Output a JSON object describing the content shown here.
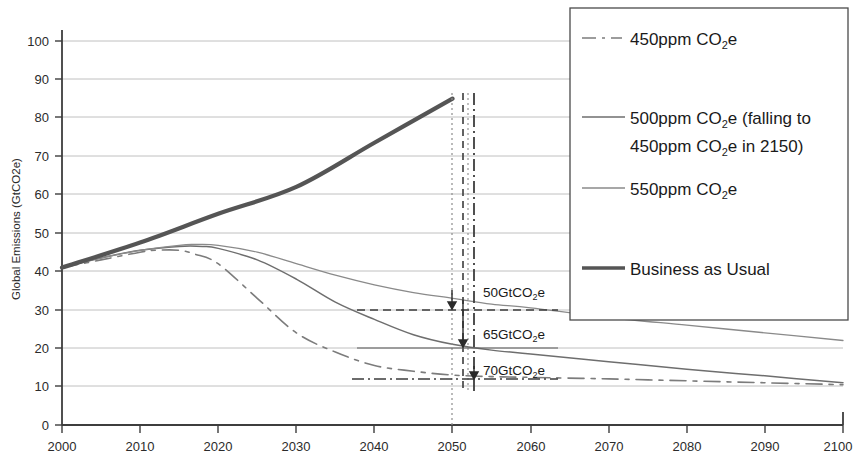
{
  "chart_data": {
    "type": "line",
    "title": "",
    "xlabel": "",
    "ylabel": "Global Emissions (GtCO2e)",
    "xlim": [
      2000,
      2100
    ],
    "ylim": [
      0,
      100
    ],
    "grid": true,
    "legend_position": "top-right",
    "x_ticks": [
      "2000",
      "2010",
      "2020",
      "2030",
      "2040",
      "2050",
      "2060",
      "2070",
      "2080",
      "2090",
      "2100"
    ],
    "y_ticks": [
      "0",
      "10",
      "20",
      "30",
      "40",
      "50",
      "60",
      "70",
      "80",
      "90",
      "100"
    ],
    "series": [
      {
        "name": "450ppm CO2e",
        "style": "dashed",
        "color": "#7c7c7c",
        "x": [
          2000,
          2005,
          2010,
          2012,
          2015,
          2017,
          2020,
          2025,
          2030,
          2035,
          2040,
          2045,
          2050,
          2055,
          2060,
          2070,
          2080,
          2090,
          2100
        ],
        "y": [
          41,
          43,
          45,
          45.5,
          45.5,
          44.5,
          42,
          33,
          24,
          19,
          15.5,
          14,
          13,
          12.6,
          12.4,
          12,
          11.5,
          11,
          10.5
        ]
      },
      {
        "name": "500ppm CO2e (falling to 450ppm CO2e in 2150)",
        "style": "solid",
        "color": "#6e6e6e",
        "x": [
          2000,
          2005,
          2010,
          2015,
          2018,
          2020,
          2025,
          2030,
          2035,
          2040,
          2045,
          2050,
          2055,
          2060,
          2070,
          2080,
          2090,
          2100
        ],
        "y": [
          41,
          43.5,
          45.5,
          46.5,
          46.5,
          46,
          43,
          38,
          32,
          27.5,
          23.5,
          21,
          19.5,
          18.5,
          16.5,
          14.5,
          12.8,
          11
        ]
      },
      {
        "name": "550ppm CO2e",
        "style": "solid-thin",
        "color": "#8a8a8a",
        "x": [
          2000,
          2005,
          2010,
          2015,
          2017,
          2020,
          2025,
          2030,
          2035,
          2040,
          2045,
          2050,
          2055,
          2060,
          2070,
          2080,
          2090,
          2100
        ],
        "y": [
          41,
          43.5,
          45.5,
          46.8,
          47,
          46.8,
          45,
          42,
          39,
          36.5,
          34.5,
          33,
          31.5,
          30.5,
          28,
          26,
          24,
          22
        ]
      },
      {
        "name": "Business as Usual",
        "style": "thick",
        "color": "#555555",
        "x": [
          2000,
          2010,
          2020,
          2030,
          2040,
          2050
        ],
        "y": [
          41,
          47.5,
          55,
          62,
          73.5,
          85
        ]
      }
    ],
    "annotations": [
      {
        "label": "50GtCO",
        "sub": "2",
        "suffix": "e",
        "x": 2053,
        "y": 33,
        "note": "reduction to 550ppm path at 2050"
      },
      {
        "label": "65GtCO",
        "sub": "2",
        "suffix": "e",
        "x": 2053,
        "y": 21,
        "note": "reduction to 500ppm path at 2050"
      },
      {
        "label": "70GtCO",
        "sub": "2",
        "suffix": "e",
        "x": 2053,
        "y": 13,
        "note": "reduction to 450ppm path at 2050"
      }
    ],
    "marker_year": 2050
  },
  "legend": {
    "items": [
      {
        "id": "legend-450",
        "line_style": "dashed",
        "text_main": "450ppm CO",
        "sub": "2",
        "text_tail": "e",
        "text_line2": ""
      },
      {
        "id": "legend-500",
        "line_style": "solid",
        "text_main": "500ppm CO",
        "sub": "2",
        "text_tail": "e  (falling to",
        "text_line2_main": "450ppm CO",
        "text_line2_sub": "2",
        "text_line2_tail": "e  in 2150)"
      },
      {
        "id": "legend-550",
        "line_style": "solid-thin",
        "text_main": "550ppm CO",
        "sub": "2",
        "text_tail": "e",
        "text_line2": ""
      },
      {
        "id": "legend-bau",
        "line_style": "thick",
        "text_main": "Business as Usual",
        "sub": "",
        "text_tail": "",
        "text_line2": ""
      }
    ]
  },
  "axes": {
    "y_title": "Global Emissions (GtCO2e)"
  },
  "colors": {
    "grid": "#b9b9b9",
    "axis": "#3d3d3d",
    "bau": "#555555",
    "s550": "#8a8a8a",
    "s500": "#6e6e6e",
    "s450": "#7c7c7c",
    "legend_border": "#4a4a4a"
  }
}
